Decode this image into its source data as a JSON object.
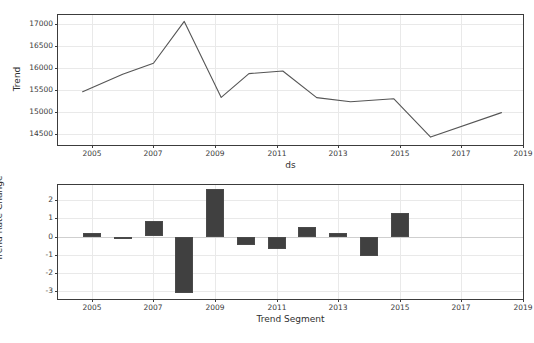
{
  "figure": {
    "suptitle": "",
    "bar_color": "#404040",
    "line_color": "#555555",
    "grid_color": "#e9e9e9",
    "background": "#ffffff"
  },
  "chart_data": [
    {
      "type": "line",
      "title": "",
      "xlabel": "ds",
      "ylabel": "Trend",
      "xlim": [
        2003.9,
        2019.0
      ],
      "ylim": [
        14250,
        17200
      ],
      "xticks": [
        2005,
        2007,
        2009,
        2011,
        2013,
        2015,
        2017,
        2019
      ],
      "xticklabels": [
        "2005",
        "2007",
        "2009",
        "2011",
        "2013",
        "2015",
        "2017",
        "2019"
      ],
      "yticks": [
        14500,
        15000,
        15500,
        16000,
        16500,
        17000
      ],
      "yticklabels": [
        "14500",
        "15000",
        "15500",
        "16000",
        "16500",
        "17000"
      ],
      "grid": true,
      "legend": "none",
      "x": [
        2004.7,
        2006.0,
        2007.0,
        2008.0,
        2009.2,
        2010.1,
        2011.2,
        2012.3,
        2013.4,
        2014.8,
        2016.0,
        2018.3
      ],
      "y": [
        15460,
        15855,
        16105,
        17055,
        15330,
        15870,
        15930,
        15325,
        15230,
        15300,
        14430,
        14985
      ]
    },
    {
      "type": "bar",
      "title": "",
      "xlabel": "Trend Segment",
      "ylabel": "Trend Rate Change",
      "xlim": [
        2003.9,
        2019.0
      ],
      "ylim": [
        -3.45,
        2.85
      ],
      "xticks": [
        2005,
        2007,
        2009,
        2011,
        2013,
        2015,
        2017,
        2019
      ],
      "xticklabels": [
        "2005",
        "2007",
        "2009",
        "2011",
        "2013",
        "2015",
        "2017",
        "2019"
      ],
      "yticks": [
        -3,
        -2,
        -1,
        0,
        1,
        2
      ],
      "yticklabels": [
        "-3",
        "-2",
        "-1",
        "0",
        "1",
        "2"
      ],
      "grid": true,
      "legend": "none",
      "categories": [
        2005,
        2006,
        2007,
        2008,
        2009,
        2010,
        2011,
        2012,
        2013,
        2014,
        2015,
        2016
      ],
      "values": [
        0.22,
        -0.13,
        0.87,
        -3.13,
        2.62,
        -0.45,
        -0.68,
        0.53,
        0.18,
        -1.08,
        1.32
      ]
    }
  ]
}
